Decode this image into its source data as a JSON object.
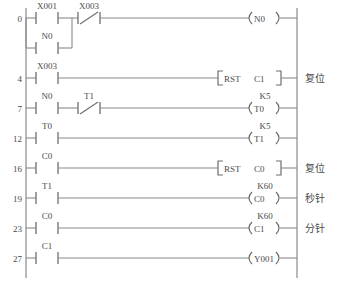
{
  "diagram": {
    "type": "ladder-logic",
    "line_color": "#8a8a8a",
    "text_color": "#4a4a4a",
    "background": "#ffffff"
  },
  "rungs": [
    {
      "step": "0",
      "contacts": [
        {
          "label": "X001",
          "type": "no"
        },
        {
          "label": "X003",
          "type": "nc"
        }
      ],
      "branch": {
        "label": "N0",
        "type": "no"
      },
      "output": {
        "kind": "coil",
        "label": "N0",
        "preset": ""
      },
      "note": ""
    },
    {
      "step": "4",
      "contacts": [
        {
          "label": "X003",
          "type": "no"
        }
      ],
      "branch": null,
      "output": {
        "kind": "instruction",
        "label": "RST",
        "operand": "C1"
      },
      "note": "复位"
    },
    {
      "step": "7",
      "contacts": [
        {
          "label": "N0",
          "type": "no"
        },
        {
          "label": "T1",
          "type": "nc"
        }
      ],
      "branch": null,
      "output": {
        "kind": "coil",
        "label": "T0",
        "preset": "K5"
      },
      "note": ""
    },
    {
      "step": "12",
      "contacts": [
        {
          "label": "T0",
          "type": "no"
        }
      ],
      "branch": null,
      "output": {
        "kind": "coil",
        "label": "T1",
        "preset": "K5"
      },
      "note": ""
    },
    {
      "step": "16",
      "contacts": [
        {
          "label": "C0",
          "type": "no"
        }
      ],
      "branch": null,
      "output": {
        "kind": "instruction",
        "label": "RST",
        "operand": "C0"
      },
      "note": "复位"
    },
    {
      "step": "19",
      "contacts": [
        {
          "label": "T1",
          "type": "no"
        }
      ],
      "branch": null,
      "output": {
        "kind": "coil",
        "label": "C0",
        "preset": "K60"
      },
      "note": "秒针"
    },
    {
      "step": "23",
      "contacts": [
        {
          "label": "C0",
          "type": "no"
        }
      ],
      "branch": null,
      "output": {
        "kind": "coil",
        "label": "C1",
        "preset": "K60"
      },
      "note": "分针"
    },
    {
      "step": "27",
      "contacts": [
        {
          "label": "C1",
          "type": "no"
        }
      ],
      "branch": null,
      "output": {
        "kind": "coil",
        "label": "Y001",
        "preset": ""
      },
      "note": ""
    }
  ]
}
